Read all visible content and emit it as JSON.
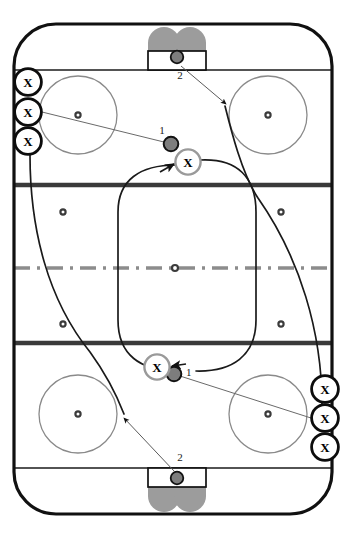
{
  "diagram": {
    "type": "hockey-rink-drill",
    "rink": {
      "width": 346,
      "height": 538,
      "board_color": "#111111",
      "ice_color": "#ffffff",
      "board_stroke_width": 3.2,
      "corner_radius": 42,
      "inset_x": 14,
      "inset_y": 24
    },
    "lines": [
      {
        "name": "goal-line-top",
        "y": 70,
        "color": "#1a1a1a",
        "thickness": 1.6,
        "style": "solid"
      },
      {
        "name": "blue-line-top",
        "y": 185,
        "color": "#3a3a3a",
        "thickness": 4.6,
        "style": "solid"
      },
      {
        "name": "center-line",
        "y": 268,
        "color": "#8c8c8c",
        "thickness": 3.4,
        "style": "dash-dot"
      },
      {
        "name": "blue-line-bottom",
        "y": 343,
        "color": "#3a3a3a",
        "thickness": 4.6,
        "style": "solid"
      },
      {
        "name": "goal-line-bottom",
        "y": 468,
        "color": "#1a1a1a",
        "thickness": 1.6,
        "style": "solid"
      }
    ],
    "faceoff_circles": [
      {
        "name": "faceoff-circle-top-left",
        "cx": 78,
        "cy": 115,
        "r": 39
      },
      {
        "name": "faceoff-circle-top-right",
        "cx": 268,
        "cy": 115,
        "r": 39
      },
      {
        "name": "faceoff-circle-bottom-left",
        "cx": 78,
        "cy": 414,
        "r": 39
      },
      {
        "name": "faceoff-circle-bottom-right",
        "cx": 268,
        "cy": 414,
        "r": 39
      }
    ],
    "faceoff_dots": [
      {
        "name": "dot-top-left",
        "cx": 78,
        "cy": 115
      },
      {
        "name": "dot-top-right",
        "cx": 268,
        "cy": 115
      },
      {
        "name": "dot-neutral-top-left",
        "cx": 63,
        "cy": 212
      },
      {
        "name": "dot-neutral-top-right",
        "cx": 281,
        "cy": 212
      },
      {
        "name": "dot-center-ice",
        "cx": 175,
        "cy": 268
      },
      {
        "name": "dot-neutral-bot-left",
        "cx": 63,
        "cy": 324
      },
      {
        "name": "dot-neutral-bot-right",
        "cx": 281,
        "cy": 324
      },
      {
        "name": "dot-bottom-left",
        "cx": 78,
        "cy": 414
      },
      {
        "name": "dot-bottom-right",
        "cx": 268,
        "cy": 414
      }
    ],
    "goals": [
      {
        "name": "goal-top",
        "x": 148,
        "y": 51,
        "w": 58,
        "h": 19,
        "crease_dir": "up"
      },
      {
        "name": "goal-bottom",
        "x": 148,
        "y": 468,
        "w": 58,
        "h": 19,
        "crease_dir": "down"
      }
    ],
    "crease_color": "#9c9c9c",
    "players": [
      {
        "name": "player-x-left-1",
        "label": "X",
        "cx": 28,
        "cy": 82,
        "r": 14,
        "ring": "black"
      },
      {
        "name": "player-x-left-2",
        "label": "X",
        "cx": 28,
        "cy": 112,
        "r": 14,
        "ring": "black"
      },
      {
        "name": "player-x-left-3",
        "label": "X",
        "cx": 28,
        "cy": 141,
        "r": 14,
        "ring": "black"
      },
      {
        "name": "player-x-right-1",
        "label": "X",
        "cx": 325,
        "cy": 389,
        "r": 14,
        "ring": "black"
      },
      {
        "name": "player-x-right-2",
        "label": "X",
        "cx": 325,
        "cy": 418,
        "r": 14,
        "ring": "black"
      },
      {
        "name": "player-x-right-3",
        "label": "X",
        "cx": 325,
        "cy": 447,
        "r": 14,
        "ring": "black"
      },
      {
        "name": "player-x-center-top",
        "label": "X",
        "cx": 188,
        "cy": 162,
        "r": 13,
        "ring": "grey"
      },
      {
        "name": "player-x-center-bottom",
        "label": "X",
        "cx": 157,
        "cy": 367,
        "r": 13,
        "ring": "grey"
      }
    ],
    "pucks": [
      {
        "name": "puck-top-goal",
        "cx": 177,
        "cy": 57,
        "r": 6.5,
        "label": "2",
        "label_x": 180,
        "label_y": 77
      },
      {
        "name": "puck-top-carrier",
        "cx": 171,
        "cy": 144,
        "r": 7.5,
        "label": "1",
        "label_x": 162,
        "label_y": 136
      },
      {
        "name": "puck-bottom-carrier",
        "cx": 174,
        "cy": 374,
        "r": 7.5,
        "label": "1",
        "label_x": 184,
        "label_y": 375
      },
      {
        "name": "puck-bottom-goal",
        "cx": 177,
        "cy": 478,
        "r": 6.5,
        "label": "2",
        "label_x": 180,
        "label_y": 459
      }
    ],
    "pass_lines": [
      {
        "name": "pass-line-upper",
        "from": "player-x-left-2",
        "to": "puck-top-carrier",
        "d": "M 42 112 L 171 144"
      },
      {
        "name": "pass-line-lower",
        "from": "player-x-right-2",
        "to": "puck-bottom-carrier",
        "d": "M 311 418 L 174 374"
      }
    ],
    "shot_arrows": [
      {
        "name": "shot-arrow-top",
        "label": "2",
        "from": "puck-top-goal",
        "to": "top-right-zone",
        "d": "M 180 66 L 224 103",
        "arrow_at": {
          "x": 224,
          "y": 103,
          "angle": 40
        }
      },
      {
        "name": "shot-arrow-bottom",
        "label": "2",
        "from": "puck-bottom-goal",
        "to": "bottom-left-zone",
        "d": "M 174 470 L 125 417",
        "arrow_at": {
          "x": 125,
          "y": 417,
          "angle": 227
        }
      }
    ],
    "skate_routes": [
      {
        "name": "skate-route-loop-left",
        "desc": "left-side route from upper-left X group curving down to bottom zone",
        "d": "M 30 155 C 30 230, 50 300, 92 355 C 108 378, 118 396, 124 414"
      },
      {
        "name": "skate-route-loop-right",
        "desc": "right-side route from lower-right X group curving up to top zone",
        "d": "M 322 403 C 322 330, 300 258, 258 196 C 242 172, 231 130, 225 105"
      },
      {
        "name": "skate-route-neutral-loop",
        "desc": "large rounded loop through the neutral zone linking both X carriers",
        "d": "M 202 163 C 236 163, 255 180, 255 212 L 255 322 C 255 356, 232 370, 198 370 L 172 370 M 174 162 C 140 162, 118 178, 118 212 L 118 322 C 118 356, 140 370, 172 370"
      }
    ],
    "arrow_color": "#111111",
    "route_color": "#1a1a1a",
    "pass_color": "#555555"
  }
}
